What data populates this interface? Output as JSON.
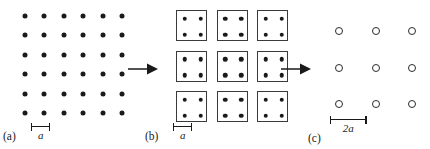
{
  "figure": {
    "background_color": "#ffffff",
    "ink_color": "#1a1a1a"
  },
  "panels": [
    {
      "id": "a",
      "label": "(a)",
      "description": "square lattice of filled sites",
      "site_style": "filled-dot",
      "rows": 6,
      "columns": 6,
      "spacing_px": 19.4,
      "origin_px": {
        "x": 25,
        "y": 16
      },
      "scalebar": {
        "label": "a",
        "length_px": 19.4,
        "x": 31,
        "y": 126
      }
    },
    {
      "id": "b",
      "label": "(b)",
      "description": "lattice partitioned into 2x2 blocks",
      "site_style": "filled-dot-in-square",
      "rows": 3,
      "columns": 3,
      "block_size_px": 31,
      "block_pitch_px": 40.5,
      "dots_per_block": 4,
      "origin_px": {
        "x": 36,
        "y": 10
      },
      "scalebar": {
        "label": "a",
        "length_px": 19.4,
        "x": 33,
        "y": 126
      }
    },
    {
      "id": "c",
      "label": "(c)",
      "description": "renormalized lattice of block variables",
      "site_style": "open-circle",
      "rows": 3,
      "columns": 3,
      "spacing_px": 36.5,
      "origin_px": {
        "x": 49,
        "y": 31
      },
      "scalebar": {
        "label": "2a",
        "length_px": 36.5,
        "x": 40,
        "y": 119
      }
    }
  ],
  "arrows": [
    {
      "id": "arrow-1",
      "direction": "right",
      "x": 128,
      "y": 69,
      "length_px": 26
    },
    {
      "id": "arrow-2",
      "direction": "right",
      "x": 281,
      "y": 69,
      "length_px": 26
    }
  ]
}
